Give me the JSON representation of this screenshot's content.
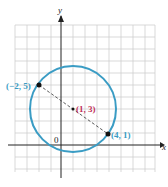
{
  "axes": {
    "x_label": "x",
    "y_label": "y",
    "origin_label": "0"
  },
  "points": [
    {
      "label": "(−2, 5)",
      "x": -2,
      "y": 5,
      "color": "#3a9cc4"
    },
    {
      "label": "(4, 1)",
      "x": 4,
      "y": 1,
      "color": "#3a9cc4"
    },
    {
      "label": "(1, 3)",
      "x": 1,
      "y": 3,
      "color": "#c0305a"
    }
  ],
  "circle": {
    "center": [
      1,
      3
    ],
    "radius_sq": 13,
    "color": "#3a9cc4"
  },
  "colors": {
    "grid": "#cfcfcf",
    "axis": "#222222"
  }
}
